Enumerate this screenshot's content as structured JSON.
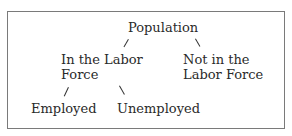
{
  "diagram": {
    "root": "Population",
    "level1": {
      "left_line1": "In the Labor",
      "left_line2": "Force",
      "right_line1": "Not in the",
      "right_line2": "Labor Force"
    },
    "level2": {
      "left": "Employed",
      "right": "Unemployed"
    },
    "connector": "/"
  }
}
